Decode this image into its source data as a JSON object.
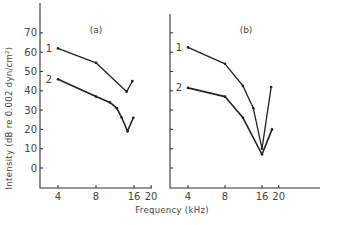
{
  "chart_data": [
    {
      "type": "line",
      "panel": "(a)",
      "title": "(a)",
      "xlabel": "Frequency (kHz)",
      "ylabel": "Intensity (dB re 0.002 dyn/cm²)",
      "xscale": "log",
      "xticks": [
        4,
        8,
        16,
        20
      ],
      "yticks": [
        0,
        10,
        20,
        30,
        40,
        50,
        60,
        70
      ],
      "ylim": [
        -10,
        85
      ],
      "grid": false,
      "series": [
        {
          "name": "1",
          "x": [
            4,
            8,
            14.0,
            15.5
          ],
          "y": [
            62,
            54.5,
            39.5,
            45
          ]
        },
        {
          "name": "2",
          "x": [
            4,
            8,
            10.3,
            11.7,
            12.8,
            14.2,
            15.8
          ],
          "y": [
            46,
            37,
            34,
            31,
            26,
            19,
            26
          ]
        }
      ]
    },
    {
      "type": "line",
      "panel": "(b)",
      "title": "(b)",
      "xlabel": "Frequency (kHz)",
      "ylabel": "Intensity (dB re 0.002 dyn/cm²)",
      "xscale": "log",
      "xticks": [
        4,
        8,
        16,
        20
      ],
      "yticks": [
        0,
        10,
        20,
        30,
        40,
        50,
        60,
        70
      ],
      "ylim": [
        -10,
        85
      ],
      "grid": false,
      "series": [
        {
          "name": "1",
          "x": [
            4,
            8,
            11.2,
            13.6,
            16,
            19
          ],
          "y": [
            62.5,
            54,
            42.5,
            31,
            10,
            42
          ]
        },
        {
          "name": "2",
          "x": [
            4,
            8,
            11.2,
            16,
            19.3
          ],
          "y": [
            41.5,
            37,
            26,
            7,
            20
          ]
        }
      ]
    }
  ],
  "labels": {
    "panel_a": "(a)",
    "panel_b": "(b)",
    "xlabel": "Frequency (kHz)",
    "ylabel": "Intensity (dB re 0.002 dyn/cm²)",
    "curve_1": "1",
    "curve_2": "2"
  }
}
